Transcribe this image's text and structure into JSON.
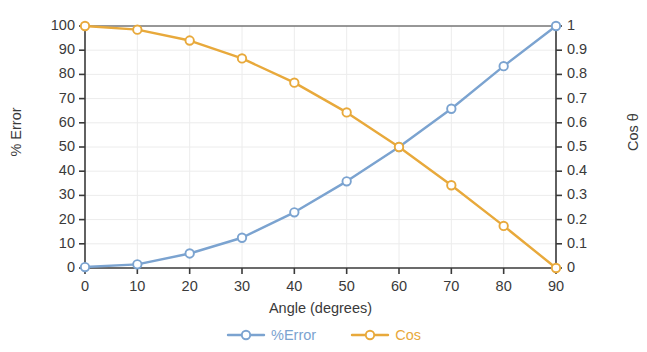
{
  "chart_data": {
    "type": "line",
    "title": "",
    "xlabel": "Angle (degrees)",
    "ylabel": "% Error",
    "ylabel_right": "Cos θ",
    "x": [
      0,
      10,
      20,
      30,
      40,
      50,
      60,
      70,
      80,
      90
    ],
    "xlim": [
      0,
      90
    ],
    "xticks": [
      "0",
      "10",
      "20",
      "30",
      "40",
      "50",
      "60",
      "70",
      "80",
      "90"
    ],
    "ylim": [
      0,
      100
    ],
    "yticks": [
      "0",
      "10",
      "20",
      "30",
      "40",
      "50",
      "60",
      "70",
      "80",
      "90",
      "100"
    ],
    "ylim_right": [
      0,
      1
    ],
    "yticks_right": [
      "0",
      "0.1",
      "0.2",
      "0.3",
      "0.4",
      "0.5",
      "0.6",
      "0.7",
      "0.8",
      "0.9",
      "1"
    ],
    "grid": true,
    "legend_position": "bottom",
    "series": [
      {
        "name": "%Error",
        "axis": "left",
        "color": "#7BA3D0",
        "marker": "open-circle",
        "values": [
          0.4,
          1.5,
          6.0,
          12.5,
          23.0,
          35.8,
          50.0,
          65.8,
          83.4,
          100.0
        ]
      },
      {
        "name": "Cos",
        "axis": "right",
        "color": "#E8A93B",
        "marker": "open-circle",
        "values": [
          1.0,
          0.985,
          0.94,
          0.866,
          0.766,
          0.643,
          0.5,
          0.342,
          0.174,
          0.0
        ]
      }
    ]
  },
  "legend": {
    "items": [
      {
        "label": "%Error",
        "color": "#7BA3D0"
      },
      {
        "label": "Cos",
        "color": "#E8A93B"
      }
    ]
  },
  "axes": {
    "left_title": "% Error",
    "right_title": "Cos θ",
    "bottom_title": "Angle (degrees)"
  },
  "colors": {
    "series_blue": "#7BA3D0",
    "series_orange": "#E8A93B",
    "axis": "#3a3a3a",
    "grid": "#ececec",
    "background": "#ffffff"
  }
}
